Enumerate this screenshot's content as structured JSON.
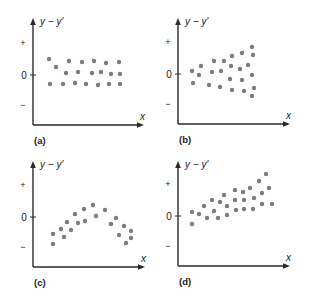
{
  "chart_data": [
    {
      "type": "scatter",
      "panel_label": "(a)",
      "ylabel": "y − y′",
      "xlabel": "x",
      "yticks": [
        "+",
        "0",
        "−"
      ],
      "description": "Residuals evenly scattered in a horizontal band about zero",
      "axis": {
        "ox": 33,
        "oy": 125,
        "top": 18,
        "right": 144,
        "zero_y": 75,
        "plus_y": 43,
        "minus_y": 105
      },
      "points": [
        [
          49,
          59
        ],
        [
          69,
          61
        ],
        [
          82,
          62
        ],
        [
          94,
          61
        ],
        [
          106,
          63
        ],
        [
          119,
          62
        ],
        [
          56,
          67
        ],
        [
          66,
          73
        ],
        [
          78,
          72
        ],
        [
          92,
          73
        ],
        [
          101,
          72
        ],
        [
          111,
          74
        ],
        [
          120,
          74
        ],
        [
          50,
          84
        ],
        [
          63,
          84
        ],
        [
          75,
          83
        ],
        [
          86,
          84
        ],
        [
          98,
          85
        ],
        [
          109,
          84
        ],
        [
          120,
          84
        ]
      ]
    },
    {
      "type": "scatter",
      "panel_label": "(b)",
      "ylabel": "y − y′",
      "xlabel": "x",
      "yticks": [
        "+",
        "0",
        "−"
      ],
      "description": "Residual spread widens as x increases (funnel shape)",
      "axis": {
        "ox": 178,
        "oy": 124,
        "top": 18,
        "right": 290,
        "zero_y": 74,
        "plus_y": 42,
        "minus_y": 104
      },
      "points": [
        [
          192,
          71
        ],
        [
          199,
          75
        ],
        [
          193,
          83
        ],
        [
          201,
          66
        ],
        [
          214,
          61
        ],
        [
          212,
          72
        ],
        [
          209,
          85
        ],
        [
          224,
          61
        ],
        [
          221,
          71
        ],
        [
          220,
          87
        ],
        [
          232,
          56
        ],
        [
          231,
          66
        ],
        [
          230,
          79
        ],
        [
          232,
          90
        ],
        [
          242,
          53
        ],
        [
          240,
          69
        ],
        [
          242,
          80
        ],
        [
          244,
          91
        ],
        [
          252,
          47
        ],
        [
          253,
          55
        ],
        [
          248,
          65
        ],
        [
          252,
          75
        ],
        [
          254,
          88
        ],
        [
          252,
          96
        ]
      ]
    },
    {
      "type": "scatter",
      "panel_label": "(c)",
      "ylabel": "y − y′",
      "xlabel": "x",
      "yticks": [
        "+",
        "0",
        "−"
      ],
      "description": "Residuals follow a curved (inverted-U) pattern",
      "axis": {
        "ox": 33,
        "oy": 267,
        "top": 161,
        "right": 145,
        "zero_y": 217,
        "plus_y": 185,
        "minus_y": 247
      },
      "points": [
        [
          53,
          234
        ],
        [
          53,
          244
        ],
        [
          61,
          229
        ],
        [
          64,
          237
        ],
        [
          67,
          222
        ],
        [
          71,
          230
        ],
        [
          75,
          214
        ],
        [
          78,
          223
        ],
        [
          84,
          209
        ],
        [
          85,
          221
        ],
        [
          93,
          205
        ],
        [
          96,
          216
        ],
        [
          105,
          210
        ],
        [
          111,
          224
        ],
        [
          116,
          218
        ],
        [
          119,
          235
        ],
        [
          124,
          226
        ],
        [
          126,
          243
        ],
        [
          131,
          231
        ],
        [
          131,
          238
        ]
      ]
    },
    {
      "type": "scatter",
      "panel_label": "(d)",
      "ylabel": "y − y′",
      "xlabel": "x",
      "yticks": [
        "+",
        "0",
        "−"
      ],
      "description": "Residuals trend upward linearly with x",
      "axis": {
        "ox": 178,
        "oy": 266,
        "top": 161,
        "right": 290,
        "zero_y": 216,
        "plus_y": 184,
        "minus_y": 246
      },
      "points": [
        [
          192,
          212
        ],
        [
          192,
          224
        ],
        [
          199,
          214
        ],
        [
          204,
          206
        ],
        [
          207,
          218
        ],
        [
          212,
          200
        ],
        [
          214,
          211
        ],
        [
          218,
          218
        ],
        [
          220,
          202
        ],
        [
          224,
          195
        ],
        [
          227,
          206
        ],
        [
          227,
          215
        ],
        [
          235,
          190
        ],
        [
          235,
          200
        ],
        [
          236,
          210
        ],
        [
          243,
          192
        ],
        [
          244,
          200
        ],
        [
          244,
          209
        ],
        [
          250,
          188
        ],
        [
          254,
          198
        ],
        [
          253,
          209
        ],
        [
          259,
          181
        ],
        [
          262,
          193
        ],
        [
          262,
          204
        ],
        [
          266,
          174
        ],
        [
          269,
          188
        ],
        [
          272,
          204
        ]
      ]
    }
  ],
  "style": {
    "axis_color": "#2a2a2a",
    "dot_color": "#7c7c7c",
    "dot_radius": 2.2,
    "text_color": "#222222"
  }
}
